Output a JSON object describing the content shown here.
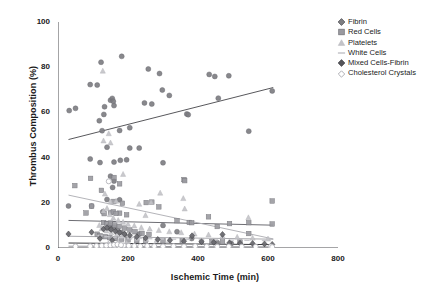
{
  "chart_data": {
    "type": "scatter",
    "title": "",
    "xlabel": "Ischemic Time (min)",
    "ylabel": "Thrombus Composition (%)",
    "xlim": [
      0,
      800
    ],
    "ylim": [
      0,
      100
    ],
    "xticks": [
      0,
      200,
      400,
      600,
      800
    ],
    "yticks": [
      0,
      20,
      40,
      60,
      80,
      100
    ],
    "xtick_labels": [
      "0",
      "200",
      "400",
      "600",
      "800"
    ],
    "ytick_labels": [
      "0",
      "20",
      "40",
      "60",
      "80",
      "100"
    ],
    "grid": false,
    "legend_position": "top-right",
    "series": [
      {
        "name": "Fibrin",
        "marker": "circle",
        "color": "#7e7e82",
        "trendline": {
          "x0": 30,
          "y0": 48.0,
          "x1": 615,
          "y1": 71.0,
          "color": "#58585c"
        },
        "points": [
          [
            32,
            60.8
          ],
          [
            50,
            61.8
          ],
          [
            92,
            72.3
          ],
          [
            112,
            72.1
          ],
          [
            123,
            82.2
          ],
          [
            118,
            56.3
          ],
          [
            126,
            51.9
          ],
          [
            131,
            59.1
          ],
          [
            133,
            62.5
          ],
          [
            150,
            65.4
          ],
          [
            155,
            66.2
          ],
          [
            158,
            64.9
          ],
          [
            160,
            63.0
          ],
          [
            182,
            84.8
          ],
          [
            176,
            52.0
          ],
          [
            205,
            53.2
          ],
          [
            247,
            64.2
          ],
          [
            258,
            79.2
          ],
          [
            268,
            63.7
          ],
          [
            290,
            77.2
          ],
          [
            298,
            69.9
          ],
          [
            318,
            67.5
          ],
          [
            368,
            59.3
          ],
          [
            372,
            59.0
          ],
          [
            432,
            76.8
          ],
          [
            448,
            75.9
          ],
          [
            458,
            66.3
          ],
          [
            488,
            76.2
          ],
          [
            545,
            51.7
          ],
          [
            612,
            69.5
          ],
          [
            92,
            39.4
          ],
          [
            120,
            37.8
          ],
          [
            140,
            44.6
          ],
          [
            150,
            31.8
          ],
          [
            160,
            29.6
          ],
          [
            160,
            38.0
          ],
          [
            178,
            38.8
          ],
          [
            196,
            39.0
          ],
          [
            205,
            44.2
          ],
          [
            232,
            44.2
          ],
          [
            300,
            37.7
          ],
          [
            140,
            21.5
          ],
          [
            176,
            21.3
          ],
          [
            156,
            26.8
          ],
          [
            232,
            6.2
          ],
          [
            30,
            18.6
          ],
          [
            96,
            18.6
          ],
          [
            128,
            16.0
          ],
          [
            300,
            10.0
          ],
          [
            148,
            10.2
          ],
          [
            150,
            8.4
          ],
          [
            160,
            9.2
          ],
          [
            170,
            7.8
          ],
          [
            180,
            6.9
          ],
          [
            190,
            6.0
          ],
          [
            340,
            7.2
          ],
          [
            382,
            4.2
          ],
          [
            455,
            2.4
          ],
          [
            495,
            2.0
          ]
        ]
      },
      {
        "name": "Red Cells",
        "marker": "square",
        "color": "#9a9aa0",
        "trendline": {
          "x0": 30,
          "y0": 12.2,
          "x1": 615,
          "y1": 10.1,
          "color": "#6e6e74"
        },
        "points": [
          [
            48,
            27.6
          ],
          [
            93,
            30.8
          ],
          [
            124,
            25.5
          ],
          [
            160,
            31.2
          ],
          [
            176,
            28.4
          ],
          [
            160,
            20.6
          ],
          [
            184,
            19.8
          ],
          [
            252,
            20.1
          ],
          [
            268,
            20.3
          ],
          [
            288,
            18.2
          ],
          [
            360,
            30.3
          ],
          [
            362,
            29.8
          ],
          [
            176,
            15.4
          ],
          [
            196,
            14.7
          ],
          [
            132,
            15.2
          ],
          [
            150,
            15.7
          ],
          [
            158,
            16.0
          ],
          [
            166,
            15.3
          ],
          [
            96,
            18.5
          ],
          [
            80,
            15.5
          ],
          [
            340,
            12.1
          ],
          [
            375,
            11.3
          ],
          [
            382,
            11.2
          ],
          [
            430,
            13.8
          ],
          [
            455,
            9.5
          ],
          [
            490,
            10.8
          ],
          [
            545,
            11.2
          ],
          [
            612,
            20.8
          ],
          [
            612,
            10.6
          ],
          [
            545,
            6.4
          ],
          [
            130,
            11.2
          ],
          [
            140,
            10.6
          ],
          [
            150,
            11.0
          ],
          [
            162,
            10.2
          ],
          [
            175,
            9.6
          ],
          [
            190,
            8.8
          ],
          [
            205,
            8.0
          ],
          [
            220,
            7.2
          ],
          [
            240,
            6.5
          ],
          [
            260,
            6.0
          ],
          [
            112,
            6.1
          ],
          [
            120,
            5.4
          ],
          [
            135,
            5.0
          ],
          [
            148,
            4.6
          ],
          [
            165,
            4.2
          ],
          [
            182,
            3.9
          ],
          [
            200,
            3.6
          ],
          [
            225,
            3.3
          ],
          [
            250,
            3.0
          ],
          [
            300,
            3.2
          ],
          [
            355,
            3.1
          ],
          [
            410,
            2.9
          ],
          [
            440,
            2.8
          ],
          [
            470,
            2.7
          ],
          [
            520,
            2.6
          ]
        ]
      },
      {
        "name": "Platelets",
        "marker": "triangle",
        "color": "#c3c3c8",
        "trendline": {
          "x0": 30,
          "y0": 23.4,
          "x1": 615,
          "y1": 4.0,
          "color": "#b4b4b9"
        },
        "points": [
          [
            128,
            78.3
          ],
          [
            130,
            47.4
          ],
          [
            145,
            50.6
          ],
          [
            150,
            46.5
          ],
          [
            186,
            32.6
          ],
          [
            134,
            23.9
          ],
          [
            150,
            20.4
          ],
          [
            166,
            20.7
          ],
          [
            232,
            19.4
          ],
          [
            266,
            20.2
          ],
          [
            292,
            24.3
          ],
          [
            358,
            21.9
          ],
          [
            362,
            17.3
          ],
          [
            250,
            14.4
          ],
          [
            544,
            13.4
          ],
          [
            130,
            16.4
          ],
          [
            140,
            17.5
          ],
          [
            148,
            14.8
          ],
          [
            158,
            13.2
          ],
          [
            172,
            12.2
          ],
          [
            186,
            11.4
          ],
          [
            200,
            10.5
          ],
          [
            218,
            9.8
          ],
          [
            238,
            9.0
          ],
          [
            262,
            8.4
          ],
          [
            288,
            7.8
          ],
          [
            318,
            7.2
          ],
          [
            352,
            6.8
          ],
          [
            390,
            6.2
          ],
          [
            430,
            5.8
          ],
          [
            470,
            5.2
          ],
          [
            512,
            4.8
          ],
          [
            556,
            4.4
          ],
          [
            600,
            4.0
          ],
          [
            118,
            10.0
          ],
          [
            125,
            8.6
          ],
          [
            138,
            7.6
          ],
          [
            152,
            6.8
          ],
          [
            168,
            6.0
          ],
          [
            184,
            5.4
          ],
          [
            204,
            4.8
          ],
          [
            226,
            4.2
          ],
          [
            252,
            3.8
          ],
          [
            282,
            3.4
          ],
          [
            316,
            3.0
          ],
          [
            172,
            2.6
          ],
          [
            196,
            2.2
          ],
          [
            144,
            2.0
          ]
        ]
      },
      {
        "name": "White Cells",
        "marker": "dash",
        "color": "#c8c8cd",
        "trendline": {
          "x0": 30,
          "y0": 5.2,
          "x1": 615,
          "y1": 3.9,
          "color": "#a8a8ad"
        },
        "points": [
          [
            120,
            5.4
          ],
          [
            140,
            5.0
          ],
          [
            160,
            4.8
          ],
          [
            180,
            4.6
          ],
          [
            205,
            4.4
          ],
          [
            232,
            4.2
          ],
          [
            262,
            4.1
          ],
          [
            295,
            4.0
          ],
          [
            330,
            3.9
          ],
          [
            370,
            3.8
          ],
          [
            410,
            3.7
          ],
          [
            450,
            3.6
          ],
          [
            495,
            3.5
          ],
          [
            540,
            3.4
          ],
          [
            590,
            3.3
          ]
        ]
      },
      {
        "name": "Mixed Cells-Fibrin",
        "marker": "diamond",
        "color": "#6a6a70",
        "trendline": {
          "x0": 30,
          "y0": 2.2,
          "x1": 615,
          "y1": 1.5,
          "color": "#3a3a3e"
        },
        "points": [
          [
            30,
            6.2
          ],
          [
            96,
            7.0
          ],
          [
            130,
            8.4
          ],
          [
            140,
            9.0
          ],
          [
            152,
            8.2
          ],
          [
            164,
            7.4
          ],
          [
            176,
            6.8
          ],
          [
            190,
            6.2
          ],
          [
            205,
            5.6
          ],
          [
            225,
            5.0
          ],
          [
            250,
            4.4
          ],
          [
            285,
            3.8
          ],
          [
            320,
            3.4
          ],
          [
            360,
            3.0
          ],
          [
            383,
            5.4
          ],
          [
            410,
            2.8
          ],
          [
            445,
            2.5
          ],
          [
            470,
            6.0
          ],
          [
            490,
            2.3
          ],
          [
            520,
            2.1
          ],
          [
            556,
            2.0
          ],
          [
            590,
            1.8
          ],
          [
            612,
            1.6
          ],
          [
            120,
            4.2
          ],
          [
            155,
            3.4
          ]
        ]
      },
      {
        "name": "Cholesterol Crystals",
        "marker": "open-circle",
        "color": "#b0b0b6",
        "trendline": {
          "x0": 30,
          "y0": 0.8,
          "x1": 615,
          "y1": 0.5,
          "color": "#9a9aa0"
        },
        "points": [
          [
            50,
            0.7
          ],
          [
            92,
            0.8
          ],
          [
            110,
            0.9
          ],
          [
            125,
            1.0
          ],
          [
            138,
            1.1
          ],
          [
            150,
            1.2
          ],
          [
            162,
            1.0
          ],
          [
            175,
            0.9
          ],
          [
            188,
            1.1
          ],
          [
            202,
            1.0
          ],
          [
            218,
            0.9
          ],
          [
            235,
            0.8
          ],
          [
            255,
            0.9
          ],
          [
            275,
            0.8
          ],
          [
            300,
            0.7
          ],
          [
            330,
            0.8
          ],
          [
            360,
            0.7
          ],
          [
            392,
            0.8
          ],
          [
            425,
            0.7
          ],
          [
            455,
            0.6
          ],
          [
            488,
            0.7
          ],
          [
            525,
            0.6
          ],
          [
            565,
            0.6
          ],
          [
            608,
            0.7
          ],
          [
            612,
            0.4
          ],
          [
            145,
            29.5
          ],
          [
            160,
            1.4
          ],
          [
            170,
            1.6
          ],
          [
            180,
            1.3
          ]
        ]
      }
    ]
  },
  "legend": {
    "items": [
      {
        "label": "Fibrin",
        "marker": "diamond-filled",
        "color": "#7e7e82"
      },
      {
        "label": "Red Cells",
        "marker": "square-filled",
        "color": "#9a9aa0"
      },
      {
        "label": "Platelets",
        "marker": "triangle-light",
        "color": "#c3c3c8"
      },
      {
        "label": "White Cells",
        "marker": "dash-light",
        "color": "#c8c8cd"
      },
      {
        "label": "Mixed Cells-Fibrin",
        "marker": "diamond-dark",
        "color": "#55555a"
      },
      {
        "label": "Cholesterol Crystals",
        "marker": "diamond-open",
        "color": "#b0b0b6"
      }
    ]
  }
}
